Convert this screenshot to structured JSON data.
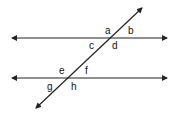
{
  "diagram": {
    "type": "parallel-lines-cut-by-transversal",
    "line_color": "#222222",
    "lines": [
      {
        "name": "top-parallel-line",
        "x1": 12,
        "y1": 38,
        "x2": 167,
        "y2": 38,
        "arrows": "both"
      },
      {
        "name": "bottom-parallel-line",
        "x1": 12,
        "y1": 78,
        "x2": 167,
        "y2": 78,
        "arrows": "both"
      },
      {
        "name": "transversal",
        "x1": 36,
        "y1": 108,
        "x2": 142,
        "y2": 8,
        "arrows": "both"
      }
    ],
    "intersections": {
      "top": {
        "x": 110,
        "y": 38
      },
      "bottom": {
        "x": 68,
        "y": 78
      }
    },
    "angle_labels": [
      {
        "text": "a",
        "x": 105,
        "y": 34
      },
      {
        "text": "b",
        "x": 128,
        "y": 34
      },
      {
        "text": "c",
        "x": 89,
        "y": 49
      },
      {
        "text": "d",
        "x": 112,
        "y": 49
      },
      {
        "text": "e",
        "x": 59,
        "y": 74
      },
      {
        "text": "f",
        "x": 85,
        "y": 74
      },
      {
        "text": "g",
        "x": 47,
        "y": 90
      },
      {
        "text": "h",
        "x": 71,
        "y": 90
      }
    ]
  }
}
